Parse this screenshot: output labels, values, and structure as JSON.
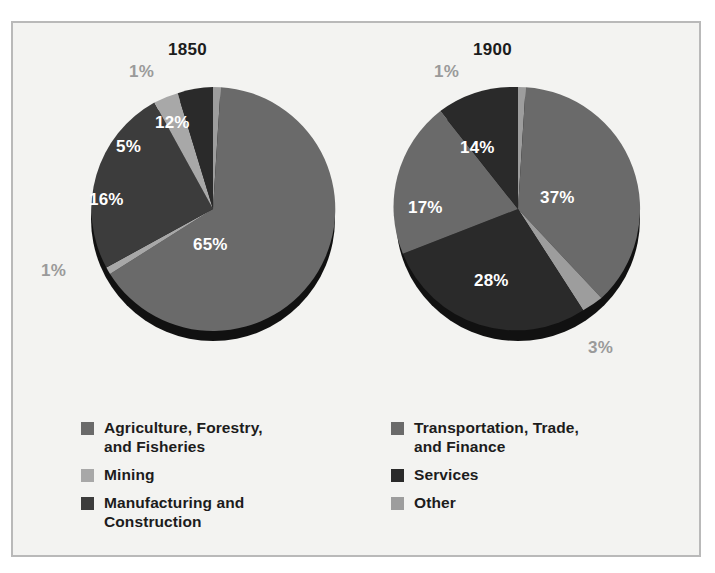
{
  "frame": {
    "background": "#f3f3f1",
    "border_color": "#b9b9b9"
  },
  "palette": {
    "agriculture": "#6a6a6a",
    "mining": "#a8a8a8",
    "manufacturing": "#3c3c3c",
    "transportation": "#6a6a6a",
    "services": "#2a2a2a",
    "other": "#9d9d9d",
    "label_inside": "#ffffff",
    "label_outside": "#9a9a9a",
    "pie_shadow": "#111111"
  },
  "charts": [
    {
      "title": "1850",
      "labels": [
        {
          "text": "1%",
          "placement": "outside"
        },
        {
          "text": "65%",
          "placement": "inside"
        },
        {
          "text": "1%",
          "placement": "outside"
        },
        {
          "text": "16%",
          "placement": "inside"
        },
        {
          "text": "5%",
          "placement": "inside"
        },
        {
          "text": "12%",
          "placement": "inside"
        }
      ]
    },
    {
      "title": "1900",
      "labels": [
        {
          "text": "1%",
          "placement": "outside"
        },
        {
          "text": "37%",
          "placement": "inside"
        },
        {
          "text": "3%",
          "placement": "outside"
        },
        {
          "text": "28%",
          "placement": "inside"
        },
        {
          "text": "17%",
          "placement": "inside"
        },
        {
          "text": "14%",
          "placement": "inside"
        }
      ]
    }
  ],
  "legend": {
    "left_items": [
      {
        "label": "Agriculture, Forestry,\nand Fisheries",
        "color": "#6a6a6a",
        "key": "agriculture"
      },
      {
        "label": "Mining",
        "color": "#a8a8a8",
        "key": "mining"
      },
      {
        "label": "Manufacturing and\nConstruction",
        "color": "#3c3c3c",
        "key": "manufacturing"
      }
    ],
    "right_items": [
      {
        "label": "Transportation, Trade,\nand Finance",
        "color": "#6a6a6a",
        "key": "transportation"
      },
      {
        "label": "Services",
        "color": "#2a2a2a",
        "key": "services"
      },
      {
        "label": "Other",
        "color": "#9d9d9d",
        "key": "other"
      }
    ]
  },
  "chart_data": {
    "type": "pie",
    "title": "",
    "charts": [
      {
        "title": "1850",
        "categories": [
          "Other",
          "Agriculture, Forestry, and Fisheries",
          "Mining",
          "Manufacturing and Construction",
          "Mining",
          "Services"
        ],
        "values": [
          1,
          65,
          1,
          16,
          5,
          12
        ],
        "value_labels": [
          "1%",
          "65%",
          "1%",
          "16%",
          "5%",
          "12%"
        ],
        "units": "percent",
        "start_angle_deg": 0,
        "direction": "clockwise"
      },
      {
        "title": "1900",
        "categories": [
          "Other",
          "Transportation, Trade, and Finance",
          "Other",
          "Services",
          "Transportation, Trade, and Finance",
          "Services"
        ],
        "values": [
          1,
          37,
          3,
          28,
          17,
          14
        ],
        "value_labels": [
          "1%",
          "37%",
          "3%",
          "28%",
          "17%",
          "14%"
        ],
        "units": "percent",
        "start_angle_deg": 0,
        "direction": "clockwise"
      }
    ],
    "legend": [
      "Agriculture, Forestry, and Fisheries",
      "Mining",
      "Manufacturing and Construction",
      "Transportation, Trade, and Finance",
      "Services",
      "Other"
    ],
    "legend_position": "bottom"
  }
}
